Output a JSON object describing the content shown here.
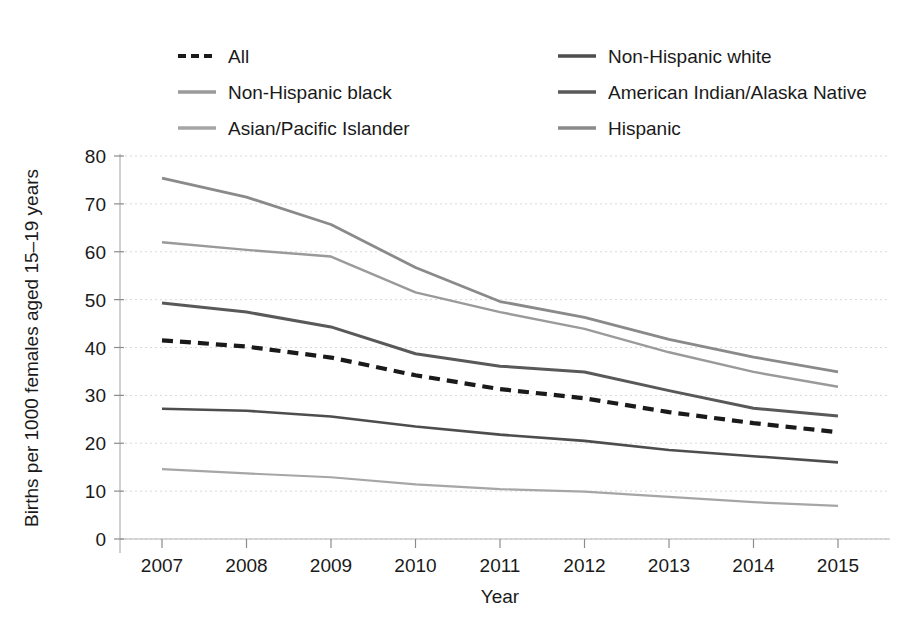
{
  "chart_data": {
    "type": "line",
    "title": "",
    "xlabel": "Year",
    "ylabel": "Births per 1000 females aged 15–19 years",
    "x": [
      2007,
      2008,
      2009,
      2010,
      2011,
      2012,
      2013,
      2014,
      2015
    ],
    "xtick_labels": [
      "2007",
      "2008",
      "2009",
      "2010",
      "2011",
      "2012",
      "2013",
      "2014",
      "2015"
    ],
    "ytick_labels": [
      "0",
      "10",
      "20",
      "30",
      "40",
      "50",
      "60",
      "70",
      "80"
    ],
    "yticks": [
      0,
      10,
      20,
      30,
      40,
      50,
      60,
      70,
      80
    ],
    "ylim": [
      0,
      80
    ],
    "xlim": [
      2007,
      2015
    ],
    "grid": true,
    "legend_position": "above-plot-two-columns",
    "series": [
      {
        "name": "All",
        "style": "dashed",
        "color": "#1a1a1a",
        "width": 4.2,
        "dash": "11 7",
        "values": [
          41.5,
          40.2,
          37.9,
          34.2,
          31.3,
          29.4,
          26.5,
          24.2,
          22.3
        ]
      },
      {
        "name": "Non-Hispanic white",
        "style": "solid",
        "color": "#4d4d4d",
        "width": 2.6,
        "dash": "",
        "values": [
          27.2,
          26.8,
          25.6,
          23.5,
          21.8,
          20.5,
          18.6,
          17.3,
          16.0
        ]
      },
      {
        "name": "Non-Hispanic black",
        "style": "solid",
        "color": "#9a9a9a",
        "width": 2.4,
        "dash": "",
        "values": [
          62.0,
          60.4,
          59.0,
          51.5,
          47.4,
          43.9,
          39.0,
          34.9,
          31.8
        ]
      },
      {
        "name": "American Indian/Alaska Native",
        "style": "solid",
        "color": "#595959",
        "width": 3.0,
        "dash": "",
        "values": [
          49.3,
          47.4,
          44.3,
          38.7,
          36.1,
          34.9,
          31.0,
          27.3,
          25.7
        ]
      },
      {
        "name": "Asian/Pacific Islander",
        "style": "solid",
        "color": "#a6a6a6",
        "width": 2.2,
        "dash": "",
        "values": [
          14.6,
          13.7,
          12.9,
          11.4,
          10.4,
          9.9,
          8.8,
          7.7,
          6.9
        ]
      },
      {
        "name": "Hispanic",
        "style": "solid",
        "color": "#8a8a8a",
        "width": 2.8,
        "dash": "",
        "values": [
          75.4,
          71.4,
          65.7,
          56.7,
          49.6,
          46.3,
          41.7,
          38.0,
          34.9
        ]
      }
    ]
  },
  "legend": {
    "entries": [
      {
        "label": "All",
        "column": 0,
        "row": 0
      },
      {
        "label": "Non-Hispanic white",
        "column": 1,
        "row": 0
      },
      {
        "label": "Non-Hispanic black",
        "column": 0,
        "row": 1
      },
      {
        "label": "American Indian/Alaska Native",
        "column": 1,
        "row": 1
      },
      {
        "label": "Asian/Pacific Islander",
        "column": 0,
        "row": 2
      },
      {
        "label": "Hispanic",
        "column": 1,
        "row": 2
      }
    ]
  },
  "axes": {
    "y_title": "Births per 1000 females aged 15–19 years",
    "x_title": "Year"
  }
}
